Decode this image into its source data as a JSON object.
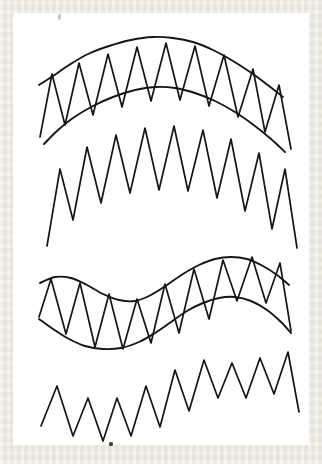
{
  "document": {
    "kind": "scanned-line-art-figure",
    "page_background_color": "#ffffff",
    "scan_border_color": "#eceade",
    "ink_color": "#151515",
    "caption": "",
    "title": ""
  },
  "artifacts": [
    {
      "name": "corner-speck",
      "x": 45,
      "y": 1,
      "width": 3,
      "height": 6,
      "color": "#9a9684"
    },
    {
      "name": "bottom-speck",
      "x": 96,
      "y": 429,
      "width": 4,
      "height": 4,
      "color": "#2a2a28"
    }
  ],
  "chart_data": {
    "type": "line",
    "title": "",
    "xlabel": "",
    "ylabel": "",
    "grid": false,
    "legend": "none",
    "xlim": [
      0,
      296
    ],
    "ylim": [
      0,
      432
    ],
    "series": [
      {
        "name": "figure-1-outer-arc",
        "role": "guide-curve",
        "stroke_width": 1.9,
        "points": [
          [
            26,
            72
          ],
          [
            40,
            63
          ],
          [
            56,
            52
          ],
          [
            75,
            41
          ],
          [
            96,
            33
          ],
          [
            118,
            27
          ],
          [
            140,
            24
          ],
          [
            160,
            25
          ],
          [
            180,
            29
          ],
          [
            200,
            37
          ],
          [
            220,
            48
          ],
          [
            240,
            61
          ],
          [
            256,
            73
          ],
          [
            270,
            84
          ]
        ]
      },
      {
        "name": "figure-1-inner-arc",
        "role": "guide-curve",
        "stroke_width": 1.9,
        "points": [
          [
            31,
            131
          ],
          [
            44,
            118
          ],
          [
            60,
            105
          ],
          [
            80,
            93
          ],
          [
            100,
            84
          ],
          [
            122,
            77
          ],
          [
            142,
            74
          ],
          [
            162,
            75
          ],
          [
            182,
            80
          ],
          [
            202,
            88
          ],
          [
            222,
            99
          ],
          [
            242,
            113
          ],
          [
            258,
            126
          ],
          [
            272,
            139
          ]
        ]
      },
      {
        "name": "figure-1-zigzag",
        "role": "zigzag-between-curves",
        "stroke_width": 1.7,
        "teeth": 10,
        "points": [
          [
            27,
            124
          ],
          [
            39,
            61
          ],
          [
            52,
            112
          ],
          [
            66,
            50
          ],
          [
            80,
            102
          ],
          [
            95,
            41
          ],
          [
            109,
            94
          ],
          [
            124,
            34
          ],
          [
            138,
            88
          ],
          [
            153,
            30
          ],
          [
            167,
            87
          ],
          [
            182,
            33
          ],
          [
            196,
            93
          ],
          [
            211,
            42
          ],
          [
            225,
            104
          ],
          [
            240,
            56
          ],
          [
            252,
            119
          ],
          [
            266,
            72
          ],
          [
            278,
            136
          ]
        ]
      },
      {
        "name": "figure-2-zigzag",
        "role": "free-zigzag-arc-baseline",
        "stroke_width": 1.7,
        "teeth": 10,
        "points": [
          [
            34,
            233
          ],
          [
            47,
            156
          ],
          [
            60,
            207
          ],
          [
            74,
            134
          ],
          [
            88,
            190
          ],
          [
            103,
            122
          ],
          [
            117,
            180
          ],
          [
            132,
            115
          ],
          [
            146,
            177
          ],
          [
            161,
            113
          ],
          [
            175,
            178
          ],
          [
            190,
            117
          ],
          [
            204,
            185
          ],
          [
            218,
            126
          ],
          [
            232,
            198
          ],
          [
            246,
            140
          ],
          [
            259,
            216
          ],
          [
            272,
            156
          ],
          [
            284,
            235
          ]
        ]
      },
      {
        "name": "figure-3-upper-s-curve",
        "role": "guide-curve",
        "stroke_width": 1.9,
        "points": [
          [
            27,
            270
          ],
          [
            42,
            264
          ],
          [
            58,
            265
          ],
          [
            74,
            272
          ],
          [
            90,
            281
          ],
          [
            106,
            287
          ],
          [
            122,
            288
          ],
          [
            138,
            282
          ],
          [
            154,
            272
          ],
          [
            170,
            261
          ],
          [
            186,
            252
          ],
          [
            202,
            246
          ],
          [
            218,
            244
          ],
          [
            234,
            246
          ],
          [
            250,
            253
          ],
          [
            264,
            262
          ],
          [
            276,
            272
          ]
        ]
      },
      {
        "name": "figure-3-lower-s-curve",
        "role": "guide-curve",
        "stroke_width": 1.9,
        "points": [
          [
            26,
            306
          ],
          [
            40,
            316
          ],
          [
            56,
            326
          ],
          [
            72,
            333
          ],
          [
            90,
            336
          ],
          [
            108,
            335
          ],
          [
            126,
            329
          ],
          [
            142,
            320
          ],
          [
            158,
            309
          ],
          [
            174,
            298
          ],
          [
            190,
            290
          ],
          [
            206,
            285
          ],
          [
            222,
            284
          ],
          [
            238,
            288
          ],
          [
            254,
            297
          ],
          [
            268,
            309
          ],
          [
            278,
            320
          ]
        ]
      },
      {
        "name": "figure-3-zigzag",
        "role": "zigzag-between-curves",
        "stroke_width": 1.7,
        "teeth": 10,
        "points": [
          [
            26,
            304
          ],
          [
            38,
            266
          ],
          [
            53,
            321
          ],
          [
            67,
            270
          ],
          [
            82,
            334
          ],
          [
            96,
            281
          ],
          [
            110,
            336
          ],
          [
            124,
            286
          ],
          [
            138,
            330
          ],
          [
            152,
            271
          ],
          [
            166,
            320
          ],
          [
            181,
            256
          ],
          [
            196,
            306
          ],
          [
            210,
            247
          ],
          [
            224,
            288
          ],
          [
            239,
            244
          ],
          [
            253,
            290
          ],
          [
            267,
            250
          ],
          [
            278,
            318
          ]
        ]
      },
      {
        "name": "figure-4-zigzag",
        "role": "free-zigzag-s-baseline",
        "stroke_width": 1.7,
        "teeth": 10,
        "points": [
          [
            28,
            413
          ],
          [
            44,
            373
          ],
          [
            60,
            423
          ],
          [
            75,
            385
          ],
          [
            90,
            428
          ],
          [
            104,
            385
          ],
          [
            118,
            423
          ],
          [
            133,
            373
          ],
          [
            147,
            414
          ],
          [
            162,
            357
          ],
          [
            176,
            398
          ],
          [
            191,
            347
          ],
          [
            205,
            385
          ],
          [
            219,
            350
          ],
          [
            233,
            385
          ],
          [
            247,
            345
          ],
          [
            261,
            381
          ],
          [
            275,
            339
          ],
          [
            286,
            399
          ]
        ]
      }
    ]
  }
}
